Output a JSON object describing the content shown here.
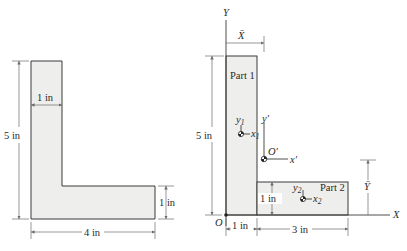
{
  "left_figure": {
    "shape": "L-section",
    "dimensions": {
      "height_label": "5 in",
      "width_label": "4 in",
      "flange_thickness_label": "1 in",
      "web_thickness_label": "1 in"
    }
  },
  "right_figure": {
    "axes": {
      "y_label": "Y",
      "x_label": "X",
      "origin_label": "O"
    },
    "centroid_labels": {
      "xbar": "X̄",
      "ybar": "Ȳ",
      "origin_prime": "O′",
      "x_prime": "x′",
      "y_prime": "y′"
    },
    "parts": [
      {
        "name": "Part 1",
        "centroid_x": "x",
        "centroid_y": "y",
        "sub": "1"
      },
      {
        "name": "Part 2",
        "centroid_x": "x",
        "centroid_y": "y",
        "sub": "2"
      }
    ],
    "dimensions": {
      "height_label": "5 in",
      "part1_width_label": "1 in",
      "part2_width_label": "3 in",
      "part2_height_label": "1 in"
    }
  },
  "colors": {
    "fill": "#eeeeec",
    "stroke": "#3a3a3a",
    "dimension": "#6a6a6a"
  }
}
